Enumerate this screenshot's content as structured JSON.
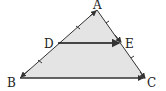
{
  "diagram": {
    "type": "triangle",
    "points": {
      "A": {
        "label": "A",
        "x": 97,
        "y": 10
      },
      "B": {
        "label": "B",
        "x": 20,
        "y": 78
      },
      "C": {
        "label": "C",
        "x": 145,
        "y": 78
      },
      "D": {
        "label": "D",
        "x": 58,
        "y": 43
      },
      "E": {
        "label": "E",
        "x": 121,
        "y": 43
      }
    },
    "segments": [
      "AB",
      "AC",
      "BC",
      "DE"
    ],
    "fill_color": "#e4e4e4",
    "stroke_color": "#333333"
  }
}
